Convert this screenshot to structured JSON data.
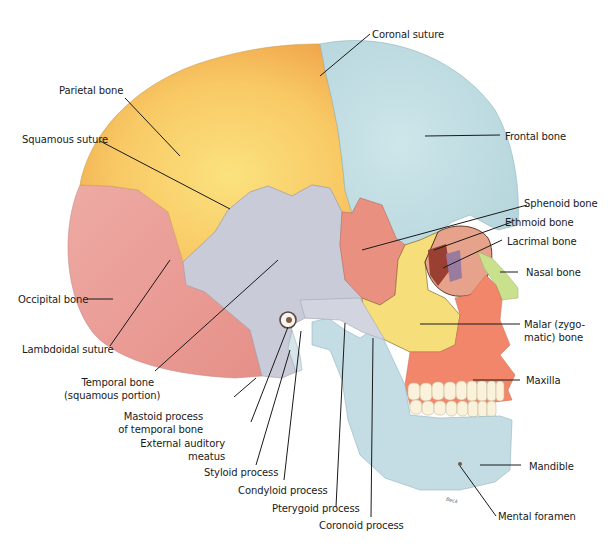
{
  "figure": {
    "signature": "Beck",
    "colors": {
      "parietal": "#f7c860",
      "frontal": "#bcdbe0",
      "occipital": "#e9a49e",
      "temporal": "#c9cbd8",
      "sphenoid": "#ea9080",
      "malar": "#f6df7a",
      "maxilla": "#f2866a",
      "mandible": "#c4dde4",
      "nasal": "#c9e08c",
      "ethmoid": "#9a4032",
      "lacrimal": "#9a7ba0",
      "teeth": "#fbf2dc",
      "leader_line": "#1a1a1a"
    }
  },
  "labels": [
    {
      "id": "coronal-suture",
      "text": "Coronal suture"
    },
    {
      "id": "parietal-bone",
      "text": "Parietal bone"
    },
    {
      "id": "frontal-bone",
      "text": "Frontal bone"
    },
    {
      "id": "squamous-suture",
      "text": "Squamous suture"
    },
    {
      "id": "sphenoid-bone",
      "text": "Sphenoid bone"
    },
    {
      "id": "ethmoid-bone",
      "text": "Ethmoid bone"
    },
    {
      "id": "lacrimal-bone",
      "text": "Lacrimal bone"
    },
    {
      "id": "nasal-bone",
      "text": "Nasal bone"
    },
    {
      "id": "occipital-bone",
      "text": "Occipital bone"
    },
    {
      "id": "malar-bone",
      "text": "Malar (zygo-",
      "text2": "matic) bone"
    },
    {
      "id": "lambdoidal-suture",
      "text": "Lambdoidal suture"
    },
    {
      "id": "maxilla",
      "text": "Maxilla"
    },
    {
      "id": "temporal-bone",
      "text": "Temporal bone",
      "text2": "(squamous portion)"
    },
    {
      "id": "mastoid-process",
      "text": "Mastoid process",
      "text2": "of temporal bone"
    },
    {
      "id": "external-auditory-meatus",
      "text": "External auditory",
      "text2": "meatus"
    },
    {
      "id": "styloid-process",
      "text": "Styloid process"
    },
    {
      "id": "condyloid-process",
      "text": "Condyloid process"
    },
    {
      "id": "mandible",
      "text": "Mandible"
    },
    {
      "id": "pterygoid-process",
      "text": "Pterygoid process"
    },
    {
      "id": "mental-foramen",
      "text": "Mental foramen"
    },
    {
      "id": "coronoid-process",
      "text": "Coronoid process"
    }
  ]
}
